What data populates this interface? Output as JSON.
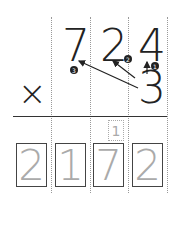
{
  "problem": {
    "operator": "×",
    "multiplicand": [
      "7",
      "2",
      "4"
    ],
    "multiplier": "3",
    "carry": "1",
    "answer": [
      "2",
      "1",
      "7",
      "2"
    ],
    "step_labels": [
      "1",
      "2",
      "3"
    ]
  }
}
